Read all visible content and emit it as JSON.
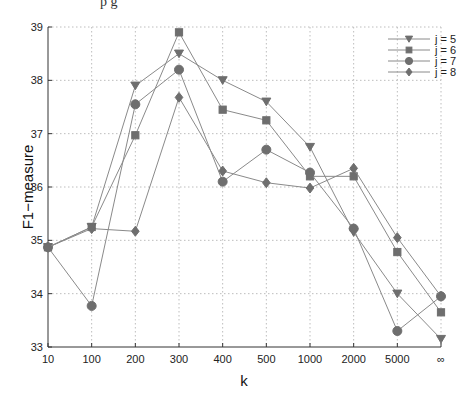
{
  "header": {
    "partial_text": "p g"
  },
  "chart_data": {
    "type": "line",
    "title": "",
    "xlabel": "k",
    "ylabel": "F1−measure",
    "categories": [
      "10",
      "100",
      "200",
      "300",
      "400",
      "500",
      "1000",
      "2000",
      "5000",
      "∞"
    ],
    "ylim": [
      33,
      39
    ],
    "yticks": [
      33,
      34,
      35,
      36,
      37,
      38,
      39
    ],
    "grid": true,
    "legend_position": "upper right",
    "series": [
      {
        "name": "j = 5",
        "marker": "triangle-down",
        "values": [
          34.87,
          35.25,
          37.9,
          38.5,
          38.0,
          37.6,
          36.75,
          35.15,
          34.0,
          33.15
        ]
      },
      {
        "name": "j = 6",
        "marker": "square",
        "values": [
          34.87,
          35.25,
          36.97,
          38.9,
          37.45,
          37.25,
          36.2,
          36.2,
          34.78,
          33.65
        ]
      },
      {
        "name": "j = 7",
        "marker": "circle",
        "values": [
          34.87,
          33.77,
          37.55,
          38.2,
          36.1,
          36.7,
          36.27,
          35.22,
          33.3,
          33.95
        ]
      },
      {
        "name": "j = 8",
        "marker": "diamond",
        "values": [
          34.87,
          35.22,
          35.17,
          37.68,
          36.3,
          36.08,
          35.98,
          36.35,
          35.05,
          33.95
        ]
      }
    ],
    "colors": {
      "line": "#8a8a8a",
      "marker": "#6e6e6e",
      "grid": "#bdbdbd",
      "axis": "#333333"
    }
  }
}
